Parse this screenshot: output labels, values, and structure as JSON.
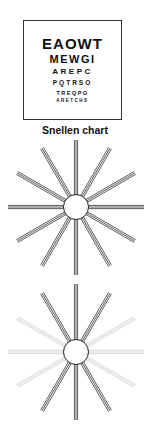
{
  "snellen_chart": {
    "rows": [
      "EAOWT",
      "MEWGI",
      "AREPC",
      "PQTRSO",
      "TREQPO",
      "ARETCHS"
    ],
    "caption": "Snellen chart"
  },
  "starburst_normal": {
    "spoke_count": 12,
    "lines_per_spoke": 3,
    "spoke_angles_deg": [
      0,
      30,
      60,
      90,
      120,
      150,
      180,
      210,
      240,
      270,
      300,
      330
    ],
    "dark_spokes_deg": [
      0,
      30,
      60,
      90,
      120,
      150,
      180,
      210,
      240,
      270,
      300,
      330
    ],
    "dark_color": "#333333",
    "faint_color": "#c8c8c8"
  },
  "starburst_astigmatic": {
    "spoke_count": 12,
    "lines_per_spoke": 3,
    "spoke_angles_deg": [
      0,
      30,
      60,
      90,
      120,
      150,
      180,
      210,
      240,
      270,
      300,
      330
    ],
    "dark_spokes_deg": [
      60,
      90,
      120,
      240,
      270,
      300
    ],
    "dark_color": "#333333",
    "faint_color": "#cfcfcf"
  }
}
